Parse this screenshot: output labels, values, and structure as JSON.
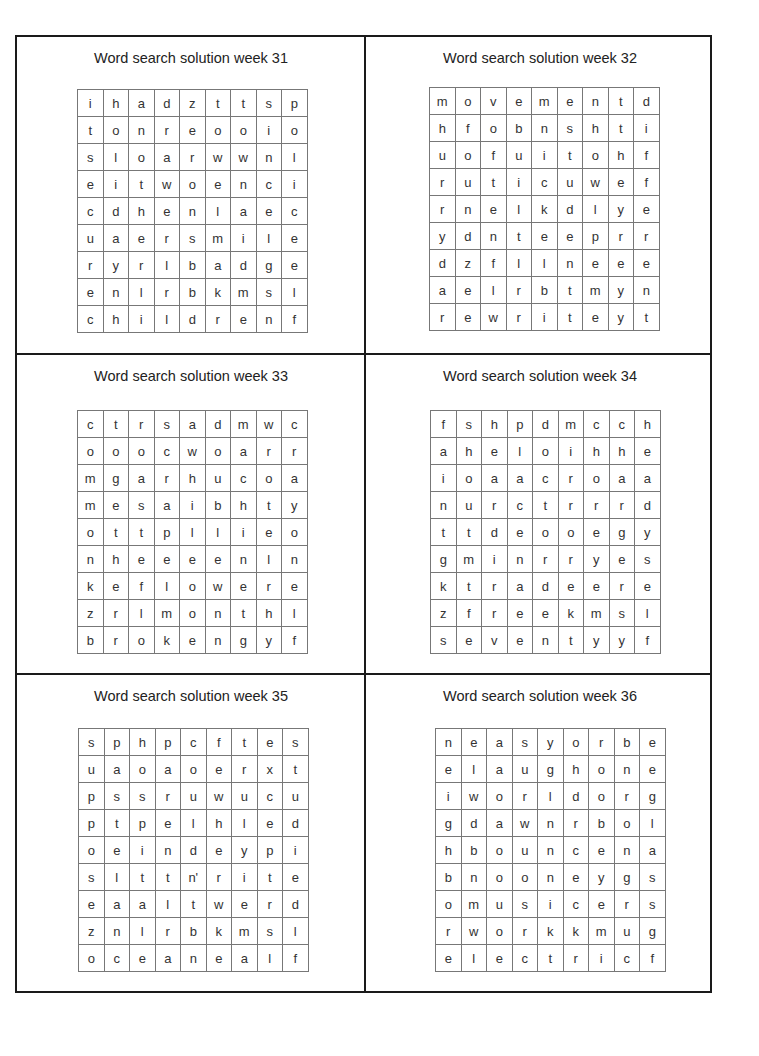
{
  "panels": [
    {
      "title": "Word search solution week 31",
      "grid": [
        [
          "i",
          "h",
          "a",
          "d",
          "z",
          "t",
          "t",
          "s",
          "p"
        ],
        [
          "t",
          "o",
          "n",
          "r",
          "e",
          "o",
          "o",
          "i",
          "o"
        ],
        [
          "s",
          "l",
          "o",
          "a",
          "r",
          "w",
          "w",
          "n",
          "l"
        ],
        [
          "e",
          "i",
          "t",
          "w",
          "o",
          "e",
          "n",
          "c",
          "i"
        ],
        [
          "c",
          "d",
          "h",
          "e",
          "n",
          "l",
          "a",
          "e",
          "c"
        ],
        [
          "u",
          "a",
          "e",
          "r",
          "s",
          "m",
          "i",
          "l",
          "e"
        ],
        [
          "r",
          "y",
          "r",
          "l",
          "b",
          "a",
          "d",
          "g",
          "e"
        ],
        [
          "e",
          "n",
          "l",
          "r",
          "b",
          "k",
          "m",
          "s",
          "l"
        ],
        [
          "c",
          "h",
          "i",
          "l",
          "d",
          "r",
          "e",
          "n",
          "f"
        ]
      ],
      "found_words": [
        "children",
        "smile",
        "badge"
      ]
    },
    {
      "title": "Word search solution week 32",
      "grid": [
        [
          "m",
          "o",
          "v",
          "e",
          "m",
          "e",
          "n",
          "t",
          "d"
        ],
        [
          "h",
          "f",
          "o",
          "b",
          "n",
          "s",
          "h",
          "t",
          "i"
        ],
        [
          "u",
          "o",
          "f",
          "u",
          "i",
          "t",
          "o",
          "h",
          "f"
        ],
        [
          "r",
          "u",
          "t",
          "i",
          "c",
          "u",
          "w",
          "e",
          "f"
        ],
        [
          "r",
          "n",
          "e",
          "l",
          "k",
          "d",
          "l",
          "y",
          "e"
        ],
        [
          "y",
          "d",
          "n",
          "t",
          "e",
          "e",
          "p",
          "r",
          "r"
        ],
        [
          "d",
          "z",
          "f",
          "l",
          "l",
          "n",
          "e",
          "e",
          "e"
        ],
        [
          "a",
          "e",
          "l",
          "r",
          "b",
          "t",
          "m",
          "y",
          "n"
        ],
        [
          "r",
          "e",
          "w",
          "r",
          "i",
          "t",
          "e",
          "y",
          "t"
        ]
      ],
      "found_words": [
        "movement",
        "different",
        "rewrite"
      ]
    },
    {
      "title": "Word search solution week 33",
      "grid": [
        [
          "c",
          "t",
          "r",
          "s",
          "a",
          "d",
          "m",
          "w",
          "c"
        ],
        [
          "o",
          "o",
          "o",
          "c",
          "w",
          "o",
          "a",
          "r",
          "r"
        ],
        [
          "m",
          "g",
          "a",
          "r",
          "h",
          "u",
          "c",
          "o",
          "a"
        ],
        [
          "m",
          "e",
          "s",
          "a",
          "i",
          "b",
          "h",
          "t",
          "y"
        ],
        [
          "o",
          "t",
          "t",
          "p",
          "l",
          "l",
          "i",
          "e",
          "o"
        ],
        [
          "n",
          "h",
          "e",
          "e",
          "e",
          "e",
          "n",
          "l",
          "n"
        ],
        [
          "k",
          "e",
          "f",
          "l",
          "o",
          "w",
          "e",
          "r",
          "e"
        ],
        [
          "z",
          "r",
          "l",
          "m",
          "o",
          "n",
          "t",
          "h",
          "l"
        ],
        [
          "b",
          "r",
          "o",
          "k",
          "e",
          "n",
          "g",
          "y",
          "f"
        ]
      ],
      "found_words": [
        "broken",
        "flower",
        "month"
      ]
    },
    {
      "title": "Word search solution week 34",
      "grid": [
        [
          "f",
          "s",
          "h",
          "p",
          "d",
          "m",
          "c",
          "c",
          "h"
        ],
        [
          "a",
          "h",
          "e",
          "l",
          "o",
          "i",
          "h",
          "h",
          "e"
        ],
        [
          "i",
          "o",
          "a",
          "a",
          "c",
          "r",
          "o",
          "a",
          "a"
        ],
        [
          "n",
          "u",
          "r",
          "c",
          "t",
          "r",
          "r",
          "r",
          "d"
        ],
        [
          "t",
          "t",
          "d",
          "e",
          "o",
          "o",
          "e",
          "g",
          "y"
        ],
        [
          "g",
          "m",
          "i",
          "n",
          "r",
          "r",
          "y",
          "e",
          "s"
        ],
        [
          "k",
          "t",
          "r",
          "a",
          "d",
          "e",
          "e",
          "r",
          "e"
        ],
        [
          "z",
          "f",
          "r",
          "e",
          "e",
          "k",
          "m",
          "s",
          "l"
        ],
        [
          "s",
          "e",
          "v",
          "e",
          "n",
          "t",
          "y",
          "y",
          "f"
        ]
      ],
      "found_words": [
        "seventy",
        "trade",
        "free"
      ]
    },
    {
      "title": "Word search solution week 35",
      "grid": [
        [
          "s",
          "p",
          "h",
          "p",
          "c",
          "f",
          "t",
          "e",
          "s"
        ],
        [
          "u",
          "a",
          "o",
          "a",
          "o",
          "e",
          "r",
          "x",
          "t"
        ],
        [
          "p",
          "s",
          "s",
          "r",
          "u",
          "w",
          "u",
          "c",
          "u"
        ],
        [
          "p",
          "t",
          "p",
          "e",
          "l",
          "h",
          "l",
          "e",
          "d"
        ],
        [
          "o",
          "e",
          "i",
          "n",
          "d",
          "e",
          "y",
          "p",
          "i"
        ],
        [
          "s",
          "l",
          "t",
          "t",
          "n'",
          "r",
          "i",
          "t",
          "e"
        ],
        [
          "e",
          "a",
          "a",
          "l",
          "t",
          "w",
          "e",
          "r",
          "d"
        ],
        [
          "z",
          "n",
          "l",
          "r",
          "b",
          "k",
          "m",
          "s",
          "l"
        ],
        [
          "o",
          "c",
          "e",
          "a",
          "n",
          "e",
          "a",
          "l",
          "f"
        ]
      ],
      "found_words": [
        "ocean",
        "tower"
      ]
    },
    {
      "title": "Word search solution week 36",
      "grid": [
        [
          "n",
          "e",
          "a",
          "s",
          "y",
          "o",
          "r",
          "b",
          "e"
        ],
        [
          "e",
          "l",
          "a",
          "u",
          "g",
          "h",
          "o",
          "n",
          "e"
        ],
        [
          "i",
          "w",
          "o",
          "r",
          "l",
          "d",
          "o",
          "r",
          "g"
        ],
        [
          "g",
          "d",
          "a",
          "w",
          "n",
          "r",
          "b",
          "o",
          "l"
        ],
        [
          "h",
          "b",
          "o",
          "u",
          "n",
          "c",
          "e",
          "n",
          "a"
        ],
        [
          "b",
          "n",
          "o",
          "o",
          "n",
          "e",
          "y",
          "g",
          "s"
        ],
        [
          "o",
          "m",
          "u",
          "s",
          "i",
          "c",
          "e",
          "r",
          "s"
        ],
        [
          "r",
          "w",
          "o",
          "r",
          "k",
          "k",
          "m",
          "u",
          "g"
        ],
        [
          "e",
          "l",
          "e",
          "c",
          "t",
          "r",
          "i",
          "c",
          "f"
        ]
      ],
      "found_words": [
        "easy",
        "laugh",
        "world",
        "dawn",
        "bounce",
        "noone",
        "music",
        "work",
        "electric",
        "neighbor"
      ]
    }
  ]
}
